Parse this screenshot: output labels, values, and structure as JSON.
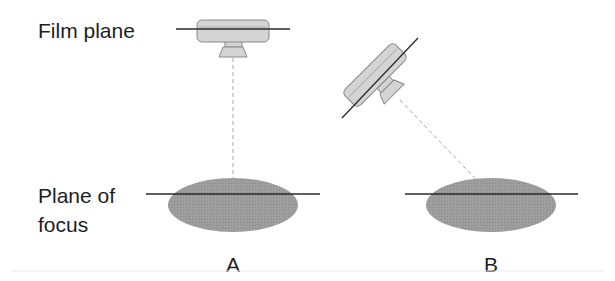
{
  "diagram": {
    "labels": {
      "film_plane": "Film plane",
      "plane_of_focus_line1": "Plane of",
      "plane_of_focus_line2": "focus"
    },
    "panels": [
      {
        "id": "A",
        "label": "A",
        "camera_orientation": "parallel to plane of focus"
      },
      {
        "id": "B",
        "label": "B",
        "camera_orientation": "tilted relative to plane of focus"
      }
    ],
    "colors": {
      "camera_body": "#d4d4d4",
      "camera_outline": "#8a8a8a",
      "subject_ellipse": "#9a9a9a",
      "plane_line": "#2a2a2a",
      "axis_dashed": "#a8a8a8",
      "text": "#1e1e1e"
    }
  }
}
